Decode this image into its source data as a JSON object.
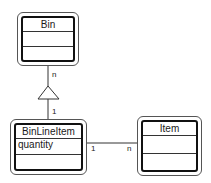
{
  "diagram": {
    "type": "UML class diagram",
    "classes": [
      {
        "id": "bin",
        "name": "Bin",
        "attributes": [],
        "operations": []
      },
      {
        "id": "binlineitem",
        "name": "BinLineItem",
        "attributes": [
          "quantity"
        ],
        "operations": []
      },
      {
        "id": "item",
        "name": "Item",
        "attributes": [],
        "operations": []
      }
    ],
    "relationships": [
      {
        "type": "generalization",
        "from": "BinLineItem",
        "to": "Bin",
        "multiplicity_top": "n",
        "multiplicity_bottom": "1"
      },
      {
        "type": "association",
        "from": "BinLineItem",
        "to": "Item",
        "multiplicity_left": "1",
        "multiplicity_right": "n"
      }
    ]
  },
  "labels": {
    "bin_name": "Bin",
    "binlineitem_name": "BinLineItem",
    "binlineitem_attr_0": "quantity",
    "item_name": "Item",
    "gen_mult_top": "n",
    "gen_mult_bottom": "1",
    "assoc_mult_left": "1",
    "assoc_mult_right": "n"
  },
  "colors": {
    "line": "#333333",
    "outer_border": "#555555",
    "inner_border": "#111111",
    "background": "#ffffff"
  }
}
